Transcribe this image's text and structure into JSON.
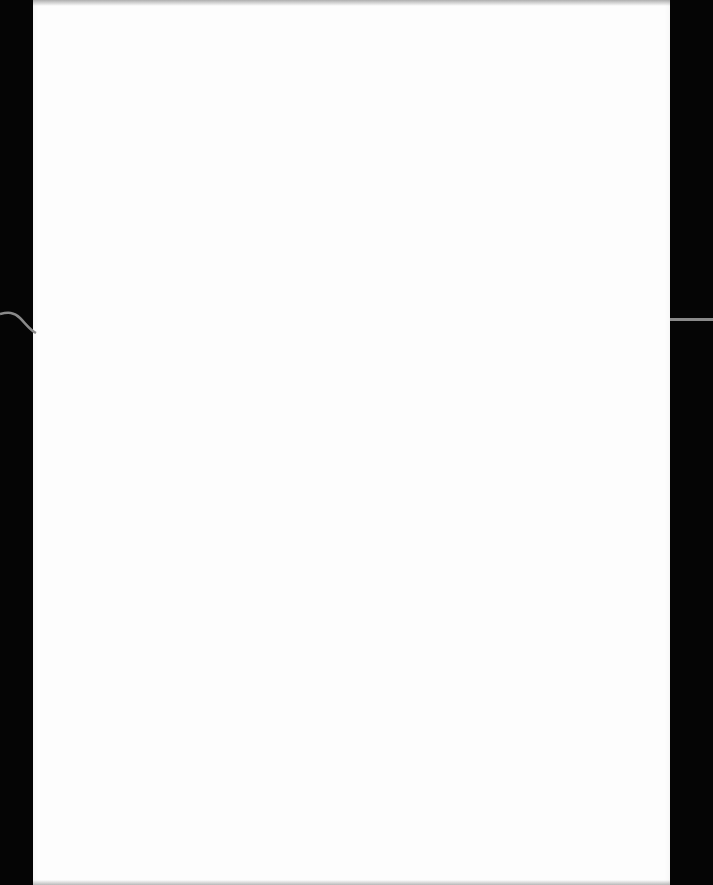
{
  "scene": {
    "description": "Blank white sheet of paper photographed on a black surface",
    "paper_text": "",
    "colors": {
      "background": "#050505",
      "paper": "#fdfdfd",
      "cable": "#8a8a8a"
    }
  }
}
